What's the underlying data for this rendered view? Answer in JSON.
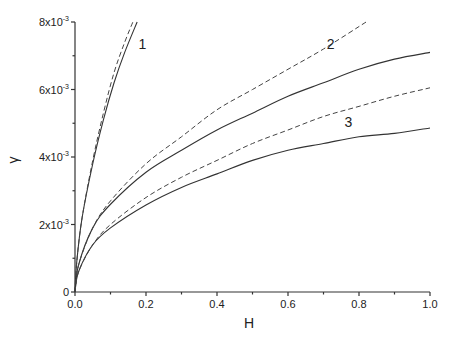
{
  "chart_data": {
    "type": "line",
    "title": "",
    "xlabel": "H",
    "ylabel": "γ",
    "xlim": [
      0.0,
      1.0
    ],
    "ylim": [
      0,
      0.008
    ],
    "grid": false,
    "legend": "none (curves labeled inline 1, 2, 3)",
    "x_ticks": [
      "0.0",
      "0.2",
      "0.4",
      "0.6",
      "0.8",
      "1.0"
    ],
    "x_minor_ticks": [
      0.1,
      0.3,
      0.5,
      0.7,
      0.9
    ],
    "y_ticks": [
      {
        "value": 0,
        "label": "0"
      },
      {
        "value": 0.002,
        "label": "2x10",
        "exp": "-3"
      },
      {
        "value": 0.004,
        "label": "4x10",
        "exp": "-3"
      },
      {
        "value": 0.006,
        "label": "6x10",
        "exp": "-3"
      },
      {
        "value": 0.008,
        "label": "8x10",
        "exp": "-3"
      }
    ],
    "y_minor_ticks": [
      0.001,
      0.003,
      0.005,
      0.007
    ],
    "series": [
      {
        "name": "1 (solid)",
        "style": "solid",
        "x": [
          0,
          0.005,
          0.02,
          0.05,
          0.08,
          0.11,
          0.14,
          0.175
        ],
        "y": [
          0,
          0.0009,
          0.0022,
          0.0038,
          0.0051,
          0.0062,
          0.0071,
          0.008
        ]
      },
      {
        "name": "1 (dashed)",
        "style": "dashed",
        "x": [
          0,
          0.005,
          0.02,
          0.05,
          0.08,
          0.11,
          0.14,
          0.163
        ],
        "y": [
          0,
          0.0009,
          0.0022,
          0.0039,
          0.0053,
          0.0065,
          0.0074,
          0.008
        ]
      },
      {
        "name": "2 (solid)",
        "style": "solid",
        "x": [
          0,
          0.01,
          0.05,
          0.1,
          0.2,
          0.3,
          0.4,
          0.5,
          0.6,
          0.7,
          0.8,
          0.9,
          1.0
        ],
        "y": [
          0,
          0.0008,
          0.0019,
          0.0026,
          0.00355,
          0.0042,
          0.0048,
          0.0053,
          0.0058,
          0.0062,
          0.0066,
          0.0069,
          0.0071
        ]
      },
      {
        "name": "2 (dashed)",
        "style": "dashed",
        "x": [
          0,
          0.01,
          0.05,
          0.1,
          0.2,
          0.3,
          0.4,
          0.5,
          0.6,
          0.7,
          0.82
        ],
        "y": [
          0,
          0.0008,
          0.0019,
          0.0027,
          0.0038,
          0.0046,
          0.0054,
          0.006,
          0.0066,
          0.0072,
          0.008
        ]
      },
      {
        "name": "3 (solid)",
        "style": "solid",
        "x": [
          0,
          0.01,
          0.05,
          0.1,
          0.2,
          0.3,
          0.4,
          0.5,
          0.6,
          0.7,
          0.8,
          0.9,
          1.0
        ],
        "y": [
          0,
          0.0006,
          0.0014,
          0.0019,
          0.00258,
          0.0031,
          0.0035,
          0.0039,
          0.0042,
          0.0044,
          0.0046,
          0.0047,
          0.00486
        ]
      },
      {
        "name": "3 (dashed)",
        "style": "dashed",
        "x": [
          0,
          0.01,
          0.05,
          0.1,
          0.2,
          0.3,
          0.4,
          0.5,
          0.6,
          0.7,
          0.8,
          0.9,
          1.0
        ],
        "y": [
          0,
          0.0006,
          0.0014,
          0.002,
          0.0028,
          0.0034,
          0.0039,
          0.0044,
          0.0048,
          0.0052,
          0.0055,
          0.0058,
          0.00605
        ]
      }
    ],
    "annotations": [
      {
        "text": "1",
        "x": 0.19,
        "y": 0.0072
      },
      {
        "text": "2",
        "x": 0.72,
        "y": 0.0072
      },
      {
        "text": "3",
        "x": 0.77,
        "y": 0.0049
      }
    ]
  }
}
